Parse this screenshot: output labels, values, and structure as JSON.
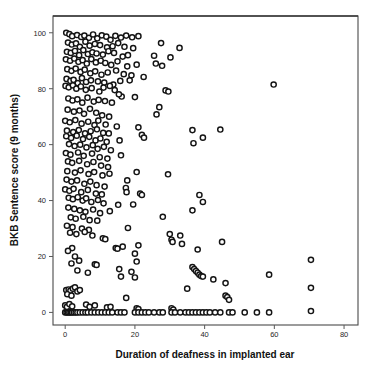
{
  "chart_data": {
    "type": "scatter",
    "title": "",
    "xlabel": "Duration of deafness in implanted ear",
    "ylabel": "BKB Sentence score (9 months)",
    "xlim": [
      -3.5,
      84
    ],
    "ylim": [
      -4.5,
      106
    ],
    "xticks": [
      0,
      20,
      40,
      60,
      80
    ],
    "xticklabels": [
      "0",
      "20",
      "40",
      "60",
      "80"
    ],
    "yticks": [
      0,
      20,
      40,
      60,
      80,
      100
    ],
    "yticklabels": [
      "0",
      "20",
      "40",
      "60",
      "80",
      "100"
    ],
    "grid": false,
    "legend": false,
    "marker": "open-circle",
    "marker_size": 5.2,
    "marker_color": "#141414",
    "marker_fill": "#ffffff",
    "n_points": 318,
    "points": [
      [
        0.3,
        100.0
      ],
      [
        1.2,
        99.5
      ],
      [
        2.0,
        98.8
      ],
      [
        3.4,
        99.2
      ],
      [
        4.6,
        98.5
      ],
      [
        5.5,
        99.0
      ],
      [
        6.8,
        98.2
      ],
      [
        8.0,
        99.4
      ],
      [
        9.2,
        98.0
      ],
      [
        10.5,
        99.1
      ],
      [
        11.8,
        98.6
      ],
      [
        13.0,
        97.5
      ],
      [
        14.4,
        98.9
      ],
      [
        16.0,
        98.3
      ],
      [
        17.5,
        99.0
      ],
      [
        19.2,
        98.4
      ],
      [
        21.0,
        98.8
      ],
      [
        0.8,
        96.5
      ],
      [
        1.9,
        95.8
      ],
      [
        3.1,
        96.2
      ],
      [
        4.2,
        95.0
      ],
      [
        5.8,
        96.8
      ],
      [
        7.0,
        95.4
      ],
      [
        8.5,
        96.0
      ],
      [
        10.0,
        95.6
      ],
      [
        12.0,
        94.8
      ],
      [
        13.6,
        95.2
      ],
      [
        15.2,
        96.3
      ],
      [
        17.0,
        95.0
      ],
      [
        19.5,
        94.5
      ],
      [
        27.5,
        96.3
      ],
      [
        32.8,
        94.6
      ],
      [
        0.5,
        93.2
      ],
      [
        1.6,
        92.8
      ],
      [
        2.8,
        93.5
      ],
      [
        4.0,
        92.0
      ],
      [
        5.2,
        93.8
      ],
      [
        6.5,
        92.4
      ],
      [
        7.8,
        93.0
      ],
      [
        9.0,
        92.6
      ],
      [
        10.8,
        92.2
      ],
      [
        12.4,
        93.4
      ],
      [
        14.0,
        92.8
      ],
      [
        16.5,
        91.5
      ],
      [
        18.0,
        92.0
      ],
      [
        25.5,
        91.8
      ],
      [
        30.2,
        91.2
      ],
      [
        0.2,
        90.5
      ],
      [
        1.4,
        90.0
      ],
      [
        2.6,
        90.8
      ],
      [
        3.8,
        89.6
      ],
      [
        5.0,
        90.2
      ],
      [
        6.2,
        89.0
      ],
      [
        7.5,
        90.6
      ],
      [
        8.8,
        89.4
      ],
      [
        10.2,
        90.0
      ],
      [
        11.5,
        89.2
      ],
      [
        13.2,
        88.5
      ],
      [
        15.0,
        89.8
      ],
      [
        17.8,
        88.0
      ],
      [
        20.5,
        88.6
      ],
      [
        26.0,
        89.0
      ],
      [
        27.8,
        88.2
      ],
      [
        0.6,
        87.0
      ],
      [
        1.8,
        86.4
      ],
      [
        3.0,
        87.2
      ],
      [
        4.4,
        86.0
      ],
      [
        5.6,
        86.8
      ],
      [
        7.2,
        85.5
      ],
      [
        8.6,
        86.2
      ],
      [
        10.4,
        85.0
      ],
      [
        12.2,
        85.8
      ],
      [
        14.6,
        86.5
      ],
      [
        16.8,
        85.2
      ],
      [
        19.0,
        84.8
      ],
      [
        22.5,
        84.2
      ],
      [
        0.4,
        83.5
      ],
      [
        1.5,
        82.8
      ],
      [
        2.4,
        83.2
      ],
      [
        3.6,
        82.0
      ],
      [
        4.8,
        83.8
      ],
      [
        6.0,
        82.4
      ],
      [
        7.4,
        83.0
      ],
      [
        9.4,
        82.6
      ],
      [
        11.2,
        82.2
      ],
      [
        13.8,
        81.5
      ],
      [
        15.8,
        82.8
      ],
      [
        18.5,
        83.0
      ],
      [
        0.1,
        81.0
      ],
      [
        1.0,
        80.5
      ],
      [
        2.2,
        81.2
      ],
      [
        3.2,
        80.0
      ],
      [
        4.5,
        80.8
      ],
      [
        5.9,
        79.6
      ],
      [
        7.6,
        80.2
      ],
      [
        9.8,
        79.0
      ],
      [
        11.0,
        80.4
      ],
      [
        12.8,
        81.0
      ],
      [
        14.2,
        79.5
      ],
      [
        16.2,
        77.2
      ],
      [
        20.0,
        77.0
      ],
      [
        28.8,
        79.4
      ],
      [
        29.6,
        79.0
      ],
      [
        59.8,
        81.5
      ],
      [
        0.9,
        76.5
      ],
      [
        2.1,
        75.8
      ],
      [
        3.5,
        76.2
      ],
      [
        4.9,
        75.0
      ],
      [
        6.4,
        76.8
      ],
      [
        8.2,
        75.4
      ],
      [
        9.6,
        76.0
      ],
      [
        11.4,
        75.6
      ],
      [
        13.4,
        75.0
      ],
      [
        15.4,
        78.0
      ],
      [
        27.0,
        73.4
      ],
      [
        0.7,
        72.5
      ],
      [
        2.5,
        71.8
      ],
      [
        4.1,
        72.2
      ],
      [
        5.4,
        71.0
      ],
      [
        7.1,
        72.8
      ],
      [
        8.9,
        71.4
      ],
      [
        10.6,
        70.5
      ],
      [
        12.6,
        70.0
      ],
      [
        26.2,
        70.8
      ],
      [
        0.0,
        68.5
      ],
      [
        1.3,
        68.0
      ],
      [
        2.9,
        68.8
      ],
      [
        4.7,
        67.5
      ],
      [
        6.6,
        68.2
      ],
      [
        8.4,
        67.0
      ],
      [
        9.5,
        68.6
      ],
      [
        11.6,
        67.2
      ],
      [
        14.8,
        66.5
      ],
      [
        21.0,
        66.2
      ],
      [
        0.5,
        65.0
      ],
      [
        2.3,
        64.5
      ],
      [
        3.9,
        65.2
      ],
      [
        5.7,
        64.0
      ],
      [
        7.3,
        64.8
      ],
      [
        9.1,
        65.5
      ],
      [
        10.9,
        64.2
      ],
      [
        12.5,
        64.0
      ],
      [
        22.0,
        63.5
      ],
      [
        22.6,
        62.5
      ],
      [
        36.5,
        65.2
      ],
      [
        44.5,
        65.4
      ],
      [
        0.3,
        63.0
      ],
      [
        1.7,
        62.4
      ],
      [
        3.3,
        63.2
      ],
      [
        5.1,
        62.0
      ],
      [
        6.9,
        62.8
      ],
      [
        8.7,
        61.5
      ],
      [
        10.1,
        62.2
      ],
      [
        11.9,
        61.0
      ],
      [
        15.6,
        61.5
      ],
      [
        36.8,
        60.5
      ],
      [
        39.5,
        62.5
      ],
      [
        1.1,
        60.2
      ],
      [
        2.7,
        59.5
      ],
      [
        4.3,
        60.0
      ],
      [
        6.1,
        59.0
      ],
      [
        7.9,
        59.8
      ],
      [
        9.3,
        58.5
      ],
      [
        11.1,
        59.2
      ],
      [
        13.1,
        58.0
      ],
      [
        16.0,
        56.2
      ],
      [
        0.2,
        57.0
      ],
      [
        1.5,
        56.4
      ],
      [
        3.7,
        57.2
      ],
      [
        5.3,
        56.0
      ],
      [
        7.7,
        56.8
      ],
      [
        9.9,
        55.5
      ],
      [
        12.1,
        55.0
      ],
      [
        0.8,
        54.0
      ],
      [
        2.0,
        53.5
      ],
      [
        4.0,
        54.2
      ],
      [
        6.3,
        53.0
      ],
      [
        8.1,
        53.8
      ],
      [
        10.3,
        52.5
      ],
      [
        12.3,
        52.0
      ],
      [
        20.5,
        50.2
      ],
      [
        29.5,
        49.4
      ],
      [
        0.6,
        50.5
      ],
      [
        2.8,
        50.0
      ],
      [
        4.4,
        50.8
      ],
      [
        6.7,
        49.5
      ],
      [
        8.3,
        50.2
      ],
      [
        10.7,
        49.0
      ],
      [
        12.7,
        49.6
      ],
      [
        17.8,
        47.2
      ],
      [
        0.4,
        47.5
      ],
      [
        1.8,
        46.8
      ],
      [
        3.4,
        47.2
      ],
      [
        5.5,
        46.0
      ],
      [
        7.2,
        46.8
      ],
      [
        9.0,
        45.5
      ],
      [
        11.3,
        45.0
      ],
      [
        17.4,
        44.5
      ],
      [
        17.6,
        43.0
      ],
      [
        21.5,
        42.5
      ],
      [
        22.0,
        42.0
      ],
      [
        38.5,
        42.0
      ],
      [
        0.0,
        44.0
      ],
      [
        1.2,
        43.5
      ],
      [
        2.4,
        44.2
      ],
      [
        4.6,
        43.0
      ],
      [
        6.5,
        43.8
      ],
      [
        8.8,
        42.5
      ],
      [
        10.5,
        42.2
      ],
      [
        39.5,
        39.5
      ],
      [
        1.0,
        41.0
      ],
      [
        2.2,
        40.5
      ],
      [
        3.6,
        41.2
      ],
      [
        5.0,
        40.0
      ],
      [
        6.0,
        40.8
      ],
      [
        7.5,
        39.5
      ],
      [
        9.4,
        40.2
      ],
      [
        11.0,
        39.0
      ],
      [
        15.2,
        38.5
      ],
      [
        19.5,
        38.6
      ],
      [
        36.5,
        36.5
      ],
      [
        0.9,
        37.5
      ],
      [
        2.6,
        37.0
      ],
      [
        4.2,
        36.5
      ],
      [
        5.8,
        36.0
      ],
      [
        8.0,
        36.8
      ],
      [
        10.0,
        35.5
      ],
      [
        12.8,
        36.2
      ],
      [
        28.0,
        34.2
      ],
      [
        1.6,
        34.0
      ],
      [
        3.0,
        33.5
      ],
      [
        5.2,
        34.2
      ],
      [
        7.0,
        33.0
      ],
      [
        9.2,
        32.8
      ],
      [
        18.0,
        30.2
      ],
      [
        0.5,
        31.0
      ],
      [
        2.1,
        30.5
      ],
      [
        4.8,
        30.0
      ],
      [
        6.8,
        29.5
      ],
      [
        1.4,
        28.5
      ],
      [
        3.2,
        28.0
      ],
      [
        5.6,
        28.8
      ],
      [
        7.8,
        27.5
      ],
      [
        10.8,
        26.5
      ],
      [
        11.5,
        26.2
      ],
      [
        14.5,
        23.0
      ],
      [
        15.0,
        22.8
      ],
      [
        16.5,
        23.5
      ],
      [
        21.0,
        24.0
      ],
      [
        30.0,
        28.0
      ],
      [
        30.5,
        26.0
      ],
      [
        30.8,
        25.2
      ],
      [
        33.0,
        27.5
      ],
      [
        33.5,
        24.5
      ],
      [
        45.0,
        25.2
      ],
      [
        2.0,
        23.0
      ],
      [
        0.8,
        22.0
      ],
      [
        20.0,
        21.0
      ],
      [
        38.0,
        22.5
      ],
      [
        2.8,
        20.0
      ],
      [
        70.5,
        18.8
      ],
      [
        4.0,
        18.5
      ],
      [
        20.5,
        18.2
      ],
      [
        1.8,
        17.5
      ],
      [
        8.5,
        17.2
      ],
      [
        9.0,
        17.0
      ],
      [
        15.5,
        15.5
      ],
      [
        19.0,
        14.5
      ],
      [
        3.5,
        15.0
      ],
      [
        6.5,
        14.2
      ],
      [
        36.5,
        16.2
      ],
      [
        37.0,
        15.5
      ],
      [
        37.5,
        14.8
      ],
      [
        38.0,
        14.2
      ],
      [
        38.5,
        13.5
      ],
      [
        39.0,
        13.0
      ],
      [
        39.5,
        12.8
      ],
      [
        42.5,
        11.8
      ],
      [
        46.0,
        10.5
      ],
      [
        58.5,
        13.5
      ],
      [
        16.0,
        12.8
      ],
      [
        20.0,
        12.5
      ],
      [
        70.5,
        8.8
      ],
      [
        35.0,
        8.5
      ],
      [
        0.3,
        8.0
      ],
      [
        1.0,
        8.2
      ],
      [
        1.5,
        7.8
      ],
      [
        2.2,
        8.5
      ],
      [
        2.8,
        9.0
      ],
      [
        3.5,
        7.5
      ],
      [
        4.2,
        8.0
      ],
      [
        0.6,
        6.5
      ],
      [
        1.8,
        6.0
      ],
      [
        17.5,
        5.2
      ],
      [
        46.0,
        6.0
      ],
      [
        46.5,
        5.5
      ],
      [
        47.0,
        4.5
      ],
      [
        0.0,
        2.5
      ],
      [
        0.5,
        2.0
      ],
      [
        1.2,
        3.0
      ],
      [
        2.0,
        2.2
      ],
      [
        6.0,
        2.8
      ],
      [
        7.0,
        2.0
      ],
      [
        8.5,
        2.5
      ],
      [
        12.0,
        1.8
      ],
      [
        13.0,
        2.0
      ],
      [
        20.5,
        1.5
      ],
      [
        21.0,
        1.2
      ],
      [
        30.5,
        1.5
      ],
      [
        31.0,
        1.0
      ],
      [
        0.0,
        0.0
      ],
      [
        0.4,
        0.0
      ],
      [
        0.8,
        0.0
      ],
      [
        1.2,
        0.0
      ],
      [
        1.6,
        0.0
      ],
      [
        2.0,
        0.0
      ],
      [
        2.5,
        0.0
      ],
      [
        3.0,
        0.0
      ],
      [
        3.5,
        0.0
      ],
      [
        4.2,
        0.0
      ],
      [
        5.0,
        0.0
      ],
      [
        5.8,
        0.0
      ],
      [
        6.5,
        0.0
      ],
      [
        7.5,
        0.0
      ],
      [
        8.5,
        0.0
      ],
      [
        9.5,
        0.0
      ],
      [
        10.5,
        0.0
      ],
      [
        11.5,
        0.0
      ],
      [
        12.5,
        0.0
      ],
      [
        13.5,
        0.0
      ],
      [
        15.0,
        0.0
      ],
      [
        16.0,
        0.0
      ],
      [
        17.0,
        0.0
      ],
      [
        20.0,
        0.0
      ],
      [
        21.0,
        0.0
      ],
      [
        22.0,
        0.0
      ],
      [
        23.0,
        0.0
      ],
      [
        24.0,
        0.0
      ],
      [
        25.5,
        0.0
      ],
      [
        27.0,
        0.0
      ],
      [
        28.0,
        0.0
      ],
      [
        30.5,
        0.0
      ],
      [
        31.5,
        0.0
      ],
      [
        33.0,
        0.0
      ],
      [
        34.5,
        0.0
      ],
      [
        35.5,
        0.0
      ],
      [
        36.5,
        0.0
      ],
      [
        37.5,
        0.0
      ],
      [
        38.5,
        0.0
      ],
      [
        39.5,
        0.0
      ],
      [
        40.5,
        0.0
      ],
      [
        41.5,
        0.0
      ],
      [
        43.0,
        0.0
      ],
      [
        44.5,
        0.0
      ],
      [
        47.0,
        0.0
      ],
      [
        48.0,
        0.0
      ],
      [
        51.5,
        0.0
      ],
      [
        55.0,
        0.0
      ],
      [
        58.5,
        0.0
      ],
      [
        70.5,
        0.5
      ]
    ]
  },
  "figure": {
    "plot_left": 53,
    "plot_top": 16,
    "plot_right": 358,
    "plot_bottom": 325,
    "tick_len": 4,
    "background": "#ffffff",
    "frame_color": "#4a4a4a"
  }
}
